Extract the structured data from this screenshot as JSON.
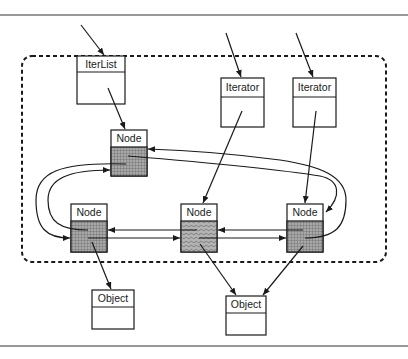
{
  "diagram": {
    "type": "object-structure",
    "boxes": {
      "iterlist": {
        "label": "IterList"
      },
      "iterator1": {
        "label": "Iterator"
      },
      "iterator2": {
        "label": "Iterator"
      },
      "node_top": {
        "label": "Node"
      },
      "node_left": {
        "label": "Node"
      },
      "node_mid": {
        "label": "Node"
      },
      "node_right": {
        "label": "Node"
      },
      "object1": {
        "label": "Object"
      },
      "object2": {
        "label": "Object"
      }
    },
    "edges": [
      {
        "from": "external",
        "to": "iterlist"
      },
      {
        "from": "external",
        "to": "iterator1"
      },
      {
        "from": "external",
        "to": "iterator2"
      },
      {
        "from": "iterlist",
        "to": "node_top"
      },
      {
        "from": "iterator1",
        "to": "node_mid"
      },
      {
        "from": "iterator2",
        "to": "node_right"
      },
      {
        "from": "node_top",
        "to": "node_left",
        "kind": "next"
      },
      {
        "from": "node_left",
        "to": "node_top",
        "kind": "prev"
      },
      {
        "from": "node_left",
        "to": "node_mid",
        "kind": "next"
      },
      {
        "from": "node_mid",
        "to": "node_left",
        "kind": "prev"
      },
      {
        "from": "node_mid",
        "to": "node_right",
        "kind": "next"
      },
      {
        "from": "node_right",
        "to": "node_mid",
        "kind": "prev"
      },
      {
        "from": "node_right",
        "to": "node_top",
        "kind": "next"
      },
      {
        "from": "node_top",
        "to": "node_right",
        "kind": "prev"
      },
      {
        "from": "node_left",
        "to": "object1"
      },
      {
        "from": "node_mid",
        "to": "object2"
      },
      {
        "from": "node_right",
        "to": "object2"
      }
    ]
  },
  "colors": {
    "stroke": "#1a1a1a",
    "node_fill": "#9a9a9a",
    "background": "#ffffff"
  }
}
